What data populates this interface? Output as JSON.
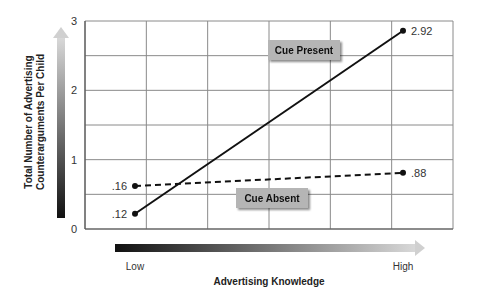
{
  "chart_data": {
    "type": "line",
    "title": "",
    "xlabel": "Advertising Knowledge",
    "ylabel_lines": [
      "Total Number of Advertising",
      "Counterarguments Per Child"
    ],
    "ylabel": "Total Number of Advertising Counterarguments Per Child",
    "categories": [
      "Low",
      "High"
    ],
    "ylim": [
      0,
      3
    ],
    "yticks": [
      0,
      1,
      2,
      3
    ],
    "grid": true,
    "label_note": "Printed point labels do not match plotted heights for three of four points; plotted_values are pixel estimates, labels are as printed.",
    "series": [
      {
        "name": "Cue Present",
        "style": "solid",
        "labels": [
          ".12",
          "2.92"
        ],
        "plotted_values": [
          0.22,
          2.86
        ]
      },
      {
        "name": "Cue Absent",
        "style": "dashed",
        "labels": [
          ".16",
          ".88"
        ],
        "plotted_values": [
          0.62,
          0.81
        ]
      }
    ],
    "x_axis_arrow_label_left": "Low",
    "x_axis_arrow_label_right": "High"
  }
}
